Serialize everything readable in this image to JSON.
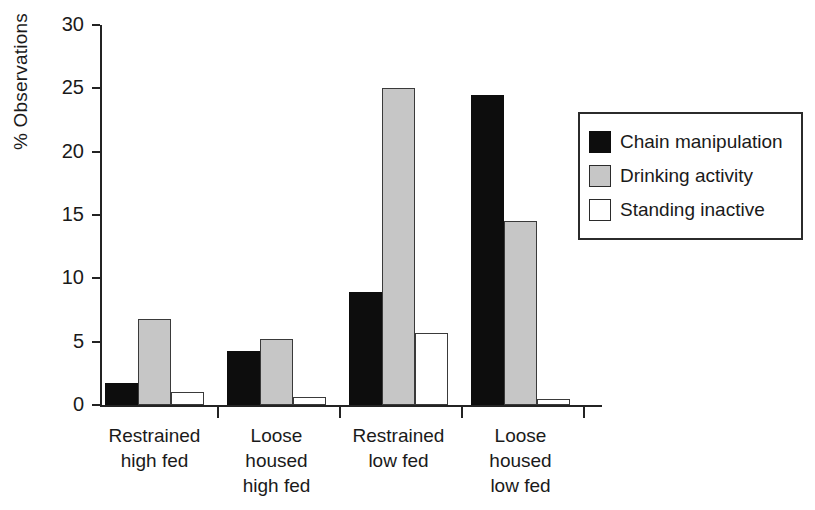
{
  "chart_data": {
    "type": "bar",
    "title": "",
    "subtitle": "",
    "xlabel": "",
    "ylabel": "% Observations",
    "ylim": [
      0,
      30
    ],
    "yticks": [
      0,
      5,
      10,
      15,
      20,
      25,
      30
    ],
    "ytick_labels": [
      "0",
      "5",
      "10",
      "15",
      "20",
      "25",
      "30"
    ],
    "grid": false,
    "legend_position": "right",
    "categories": [
      "Restrained\nhigh fed",
      "Loose\nhoused\nhigh fed",
      "Restrained\nlow fed",
      "Loose\nhoused\nlow fed"
    ],
    "series": [
      {
        "name": "Chain manipulation",
        "color": "#0d0d0d",
        "values": [
          1.7,
          4.3,
          8.9,
          24.5
        ]
      },
      {
        "name": "Drinking activity",
        "color": "#c6c6c6",
        "values": [
          6.8,
          5.2,
          25.0,
          14.5
        ]
      },
      {
        "name": "Standing inactive",
        "color": "#ffffff",
        "values": [
          1.0,
          0.6,
          5.7,
          0.5
        ]
      }
    ]
  },
  "legend": {
    "items": [
      {
        "label": "Chain manipulation",
        "swatch": "black"
      },
      {
        "label": "Drinking activity",
        "swatch": "gray"
      },
      {
        "label": "Standing inactive",
        "swatch": "white"
      }
    ]
  }
}
